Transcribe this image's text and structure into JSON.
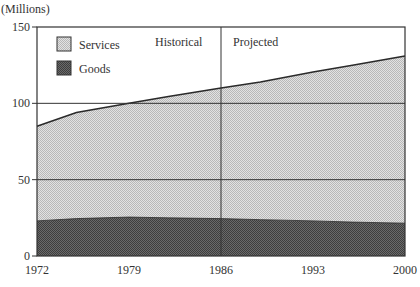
{
  "chart_data": {
    "type": "area",
    "stacked": true,
    "title": "",
    "ylabel": "(Millions)",
    "xlabel": "",
    "x": [
      1972,
      1975,
      1979,
      1982,
      1986,
      1989,
      1993,
      1996,
      2000
    ],
    "series": [
      {
        "name": "Goods",
        "color": "#555555",
        "values": [
          23,
          24.5,
          25.5,
          25,
          24.5,
          23.8,
          23,
          22.2,
          21.5
        ]
      },
      {
        "name": "Services",
        "color": "#d4d4d4",
        "values": [
          62,
          69.5,
          74.5,
          79.5,
          85.5,
          90.2,
          97.5,
          102.8,
          109.5
        ]
      }
    ],
    "totals": [
      85,
      94,
      100,
      104.5,
      110,
      114,
      120.5,
      125,
      131
    ],
    "xticks": [
      "1972",
      "1979",
      "1986",
      "1993",
      "2000"
    ],
    "yticks": [
      "0",
      "50",
      "100",
      "150"
    ],
    "ylim": [
      0,
      150
    ],
    "xlim": [
      1972,
      2000
    ],
    "grid": "horizontal at 50 and 100",
    "legend": {
      "position": "upper-left",
      "entries": [
        "Services",
        "Goods"
      ]
    },
    "annotations": [
      {
        "text": "Historical",
        "x": 1986,
        "side": "left"
      },
      {
        "text": "Projected",
        "x": 1986,
        "side": "right"
      }
    ],
    "divider_x": 1986
  },
  "labels": {
    "units": "(Millions)",
    "historical": "Historical",
    "projected": "Projected",
    "legend_services": "Services",
    "legend_goods": "Goods"
  }
}
